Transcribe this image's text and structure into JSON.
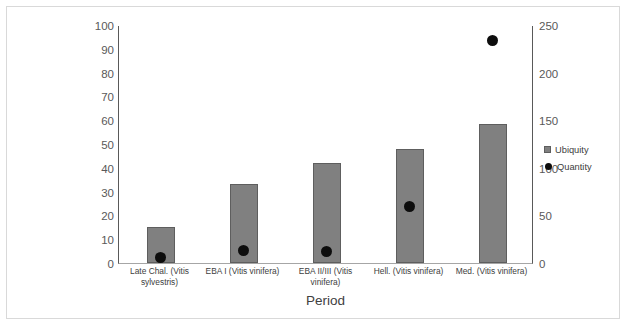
{
  "chart_data": {
    "type": "bar",
    "title": "",
    "subtitle": "",
    "xlabel": "Period",
    "ylabel": "",
    "grid": false,
    "legend_position": "right",
    "categories": [
      "Late Chal. (Vitis sylvestris)",
      "EBA I (Vitis vinifera)",
      "EBA II/III (Vitis vinifera)",
      "Hell. (Vitis vinifera)",
      "Med. (Vitis vinifera)"
    ],
    "series": [
      {
        "name": "Ubiquity",
        "type": "bar",
        "axis": "left",
        "color": "#808080",
        "values": [
          15,
          33,
          42,
          48,
          58.5
        ]
      },
      {
        "name": "Quantity",
        "type": "scatter",
        "axis": "right",
        "color": "#0d0d0d",
        "values": [
          7,
          14,
          13,
          60,
          235
        ]
      }
    ],
    "left_axis": {
      "label": "",
      "ylim": [
        0,
        100
      ],
      "ticks": [
        0,
        10,
        20,
        30,
        40,
        50,
        60,
        70,
        80,
        90,
        100
      ],
      "tick_labels": [
        "0",
        "10",
        "20",
        "30",
        "40",
        "50",
        "60",
        "70",
        "80",
        "90",
        "100"
      ]
    },
    "right_axis": {
      "label": "",
      "ylim": [
        0,
        250
      ],
      "ticks": [
        0,
        50,
        100,
        150,
        200,
        250
      ],
      "tick_labels": [
        "0",
        "50",
        "100",
        "150",
        "200",
        "250"
      ]
    },
    "legend": [
      {
        "label": "Ubiquity",
        "marker": "square",
        "color": "#808080"
      },
      {
        "label": "Quantity",
        "marker": "circle",
        "color": "#0d0d0d"
      }
    ]
  },
  "axis_title": "Period",
  "colors": {
    "bar_fill": "#808080",
    "bar_stroke": "#5e5e5e",
    "dot": "#0d0d0d",
    "axis_line": "#595959",
    "frame": "#d9d9d9",
    "text": "#404040"
  }
}
